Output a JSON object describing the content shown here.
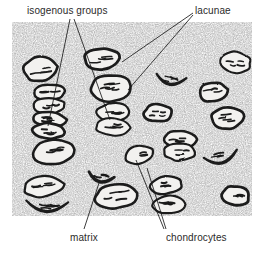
{
  "figure": {
    "background_color": "#ffffff",
    "matrix_texture_color": "#8a8a8a",
    "ink_color": "#1a1a1a",
    "label_color": "#2b2b2b",
    "cell_fill_color": "#f2f1ef",
    "nucleus_color": "#1a1a1a"
  },
  "labels": [
    {
      "id": "isogenous",
      "text": "isogenous groups",
      "position": "top-left",
      "leader_count": 2
    },
    {
      "id": "lacunae",
      "text": "lacunae",
      "position": "top-right",
      "leader_count": 2
    },
    {
      "id": "matrix",
      "text": "matrix",
      "position": "bottom-left",
      "leader_count": 1
    },
    {
      "id": "chondrocytes",
      "text": "chondrocytes",
      "position": "bottom-right",
      "leader_count": 2
    }
  ],
  "frame": {
    "x": 12,
    "y": 22,
    "width": 240,
    "height": 194
  },
  "cells": [
    {
      "cx": 40,
      "cy": 69,
      "rx": 17,
      "ry": 12,
      "rot": -8,
      "shape": "oval"
    },
    {
      "cx": 102,
      "cy": 59,
      "rx": 18,
      "ry": 11,
      "rot": -4,
      "shape": "oval"
    },
    {
      "cx": 236,
      "cy": 62,
      "rx": 15,
      "ry": 11,
      "rot": 6,
      "shape": "oval"
    },
    {
      "cx": 110,
      "cy": 88,
      "rx": 20,
      "ry": 14,
      "rot": -6,
      "shape": "oval"
    },
    {
      "cx": 171,
      "cy": 79,
      "rx": 15,
      "ry": 10,
      "rot": 10,
      "shape": "crescent"
    },
    {
      "cx": 213,
      "cy": 92,
      "rx": 14,
      "ry": 10,
      "rot": -10,
      "shape": "oval"
    },
    {
      "cx": 49,
      "cy": 92,
      "rx": 16,
      "ry": 8,
      "rot": -3,
      "shape": "stack"
    },
    {
      "cx": 49,
      "cy": 106,
      "rx": 17,
      "ry": 8,
      "rot": -2,
      "shape": "stack"
    },
    {
      "cx": 49,
      "cy": 119,
      "rx": 17,
      "ry": 8,
      "rot": 2,
      "shape": "stack"
    },
    {
      "cx": 49,
      "cy": 131,
      "rx": 16,
      "ry": 8,
      "rot": 4,
      "shape": "stack"
    },
    {
      "cx": 113,
      "cy": 112,
      "rx": 17,
      "ry": 9,
      "rot": -4,
      "shape": "stack"
    },
    {
      "cx": 113,
      "cy": 127,
      "rx": 18,
      "ry": 9,
      "rot": 3,
      "shape": "stack"
    },
    {
      "cx": 158,
      "cy": 113,
      "rx": 14,
      "ry": 9,
      "rot": 0,
      "shape": "oval"
    },
    {
      "cx": 228,
      "cy": 118,
      "rx": 17,
      "ry": 11,
      "rot": -6,
      "shape": "oval"
    },
    {
      "cx": 180,
      "cy": 139,
      "rx": 16,
      "ry": 9,
      "rot": 2,
      "shape": "stack"
    },
    {
      "cx": 180,
      "cy": 152,
      "rx": 16,
      "ry": 9,
      "rot": 0,
      "shape": "stack"
    },
    {
      "cx": 54,
      "cy": 152,
      "rx": 21,
      "ry": 13,
      "rot": -6,
      "shape": "oval"
    },
    {
      "cx": 139,
      "cy": 155,
      "rx": 15,
      "ry": 9,
      "rot": -8,
      "shape": "oval"
    },
    {
      "cx": 221,
      "cy": 157,
      "rx": 17,
      "ry": 11,
      "rot": -12,
      "shape": "crescent"
    },
    {
      "cx": 43,
      "cy": 186,
      "rx": 20,
      "ry": 11,
      "rot": -5,
      "shape": "oval"
    },
    {
      "cx": 47,
      "cy": 205,
      "rx": 21,
      "ry": 12,
      "rot": 4,
      "shape": "crescent"
    },
    {
      "cx": 166,
      "cy": 185,
      "rx": 16,
      "ry": 9,
      "rot": -6,
      "shape": "oval"
    },
    {
      "cx": 168,
      "cy": 205,
      "rx": 16,
      "ry": 9,
      "rot": -2,
      "shape": "oval"
    },
    {
      "cx": 116,
      "cy": 196,
      "rx": 22,
      "ry": 13,
      "rot": -8,
      "shape": "oval"
    },
    {
      "cx": 236,
      "cy": 196,
      "rx": 14,
      "ry": 10,
      "rot": 8,
      "shape": "oval"
    },
    {
      "cx": 101,
      "cy": 177,
      "rx": 13,
      "ry": 9,
      "rot": 14,
      "shape": "crescent"
    }
  ],
  "leader_lines": [
    {
      "label": "isogenous",
      "x1": 70,
      "y1": 19,
      "x2": 48,
      "y2": 126
    },
    {
      "label": "isogenous",
      "x1": 74,
      "y1": 19,
      "x2": 110,
      "y2": 120
    },
    {
      "label": "lacunae",
      "x1": 193,
      "y1": 13,
      "x2": 122,
      "y2": 62
    },
    {
      "label": "lacunae",
      "x1": 193,
      "y1": 15,
      "x2": 128,
      "y2": 90
    },
    {
      "label": "matrix",
      "x1": 84,
      "y1": 229,
      "x2": 100,
      "y2": 180
    },
    {
      "label": "chondrocytes",
      "x1": 164,
      "y1": 229,
      "x2": 136,
      "y2": 160
    },
    {
      "label": "chondrocytes",
      "x1": 166,
      "y1": 229,
      "x2": 147,
      "y2": 168
    }
  ]
}
